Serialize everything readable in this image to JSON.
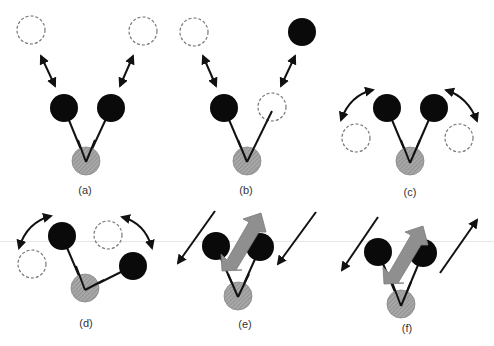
{
  "figure": {
    "colors": {
      "outer_atom": "#0a0a0a",
      "central_atom": "#9a9a9a",
      "ghost_outline": "#777777",
      "arrow": "#111111",
      "block_arrow": "#8f8f8f"
    },
    "panels": [
      {
        "id": "a",
        "label": "(a)",
        "mode": "symmetric stretch"
      },
      {
        "id": "b",
        "label": "(b)",
        "mode": "asymmetric stretch"
      },
      {
        "id": "c",
        "label": "(c)",
        "mode": "scissoring"
      },
      {
        "id": "d",
        "label": "(d)",
        "mode": "rocking"
      },
      {
        "id": "e",
        "label": "(e)",
        "mode": "wagging"
      },
      {
        "id": "f",
        "label": "(f)",
        "mode": "twisting"
      }
    ]
  }
}
